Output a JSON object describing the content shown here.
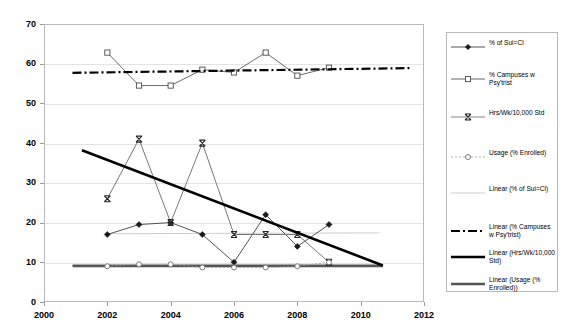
{
  "chart_data": {
    "type": "line",
    "title": "",
    "xlabel": "",
    "ylabel": "",
    "xlim": [
      2000,
      2012
    ],
    "ylim": [
      0,
      70
    ],
    "xticks": [
      "2000",
      "2002",
      "2004",
      "2006",
      "2008",
      "2010",
      "2012"
    ],
    "xtick_values": [
      2000,
      2002,
      2004,
      2006,
      2008,
      2010,
      2012
    ],
    "yticks": [
      "0",
      "10",
      "20",
      "30",
      "40",
      "50",
      "60",
      "70"
    ],
    "ytick_values": [
      0,
      10,
      20,
      30,
      40,
      50,
      60,
      70
    ],
    "grid": true,
    "legend_position": "right",
    "x": [
      2002,
      2003,
      2004,
      2005,
      2006,
      2007,
      2008,
      2009
    ],
    "series": [
      {
        "name": "% of Sui=Cl",
        "marker": "filled-diamond",
        "color": "#404040",
        "values": [
          17.0,
          19.5,
          20.0,
          17.0,
          10.0,
          22.0,
          14.0,
          19.5
        ]
      },
      {
        "name": "% Campuses w Psy'trist",
        "marker": "open-square",
        "color": "#595959",
        "values": [
          62.8,
          54.5,
          54.5,
          58.5,
          57.8,
          62.8,
          57.0,
          59.0
        ]
      },
      {
        "name": "Hrs/Wk/10,000 Std",
        "marker": "x-cross",
        "color": "#777777",
        "values": [
          26.0,
          41.0,
          20.0,
          40.0,
          17.0,
          17.0,
          17.0,
          10.0
        ]
      },
      {
        "name": "Usage (% Enrolled)",
        "marker": "open-circle",
        "color": "#9a9a9a",
        "values": [
          9.0,
          9.5,
          9.5,
          8.7,
          8.7,
          8.7,
          9.0,
          10.0
        ]
      }
    ],
    "trendlines": [
      {
        "name": "Linear (% of Sui=Cl)",
        "style": "thin-solid",
        "color": "#c8c8c8",
        "x_start": 2002,
        "y_start": 17.2,
        "x_end": 2010.6,
        "y_end": 17.4
      },
      {
        "name": "Linear (% Campuses w Psy'trist)",
        "style": "dash-dot",
        "color": "#000000",
        "x_start": 2000.9,
        "y_start": 57.7,
        "x_end": 2011.6,
        "y_end": 58.9
      },
      {
        "name": "Linear (Hrs/Wk/10,000 Std)",
        "style": "thick-solid",
        "color": "#000000",
        "x_start": 2001.2,
        "y_start": 38.2,
        "x_end": 2010.7,
        "y_end": 9.2
      },
      {
        "name": "Linear (Usage (% Enrolled))",
        "style": "thick-solid",
        "color": "#555555",
        "x_start": 2000.9,
        "y_start": 9.1,
        "x_end": 2010.7,
        "y_end": 9.1
      }
    ],
    "legend": [
      {
        "label": "% of Sui=Cl",
        "key": "line-filled-diamond"
      },
      {
        "label": "% Campuses w Psy'trist",
        "key": "line-open-square"
      },
      {
        "label": "Hrs/Wk/10,000 Std",
        "key": "line-x-cross"
      },
      {
        "label": "Usage (% Enrolled)",
        "key": "dotted-open-circle"
      },
      {
        "label": "Linear (% of Sui=Cl)",
        "key": "thin-solid"
      },
      {
        "label": "Linear (% Campuses w Psy'trist)",
        "key": "dash-dot"
      },
      {
        "label": "Linear (Hrs/Wk/10,000 Std)",
        "key": "thick-solid-black"
      },
      {
        "label": "Linear (Usage (% Enrolled))",
        "key": "thick-solid-gray"
      }
    ]
  }
}
